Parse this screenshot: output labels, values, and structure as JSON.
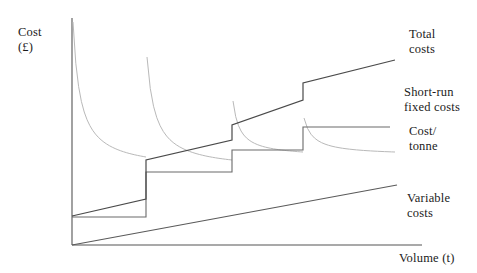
{
  "axes": {
    "y_label": "Cost\n(£)",
    "x_label": "Volume (t)"
  },
  "legend": {
    "total_costs": "Total\ncosts",
    "short_run_fixed_costs": "Short-run\nfixed costs",
    "cost_per_tonne": "Cost/\ntonne",
    "variable_costs": "Variable\ncosts"
  },
  "colors": {
    "axis": "#555555",
    "total_costs": "#4a4a4a",
    "fixed_costs": "#6a6a6a",
    "variable_costs": "#5a5a5a",
    "cost_per_tonne": "#b9b9b9",
    "text": "#1b1b1b",
    "background": "#ffffff"
  },
  "chart_data": {
    "type": "line",
    "title": "",
    "xlabel": "Volume (t)",
    "ylabel": "Cost (£)",
    "grid": false,
    "legend_position": "right",
    "axis_origin_px": [
      72,
      245
    ],
    "axis_extent_px": [
      422,
      18
    ],
    "step_breaks_x": [
      146,
      232,
      303
    ],
    "series": [
      {
        "name": "Short-run fixed costs",
        "type": "step",
        "style": "solid",
        "color": "#6a6a6a",
        "segments": [
          {
            "x_start": 72,
            "x_end": 146,
            "y": 217
          },
          {
            "x_start": 146,
            "x_end": 232,
            "y": 172
          },
          {
            "x_start": 232,
            "x_end": 303,
            "y": 150
          },
          {
            "x_start": 303,
            "x_end": 390,
            "y": 127
          }
        ]
      },
      {
        "name": "Total costs",
        "type": "step-plus-slope",
        "style": "solid",
        "color": "#4a4a4a",
        "segments": [
          {
            "x_start": 72,
            "y_start": 216,
            "x_end": 146,
            "y_end": 199
          },
          {
            "x_start": 146,
            "y_start": 160,
            "x_end": 232,
            "y_end": 140
          },
          {
            "x_start": 232,
            "y_start": 125,
            "x_end": 303,
            "y_end": 100
          },
          {
            "x_start": 303,
            "y_start": 83,
            "x_end": 395,
            "y_end": 60
          }
        ]
      },
      {
        "name": "Variable costs",
        "type": "line",
        "style": "solid",
        "color": "#5a5a5a",
        "points": [
          [
            72,
            245
          ],
          [
            397,
            185
          ]
        ]
      },
      {
        "name": "Cost/tonne",
        "type": "hyperbola-segments",
        "style": "solid-light",
        "color": "#b9b9b9",
        "segments": [
          {
            "x_start": 72,
            "x_end": 146,
            "y_peak": 22,
            "y_end": 157
          },
          {
            "x_start": 146,
            "x_end": 232,
            "y_peak": 57,
            "y_end": 160
          },
          {
            "x_start": 232,
            "x_end": 303,
            "y_peak": 101,
            "y_end": 152
          },
          {
            "x_start": 303,
            "x_end": 395,
            "y_peak": 118,
            "y_end": 152
          }
        ]
      }
    ]
  }
}
